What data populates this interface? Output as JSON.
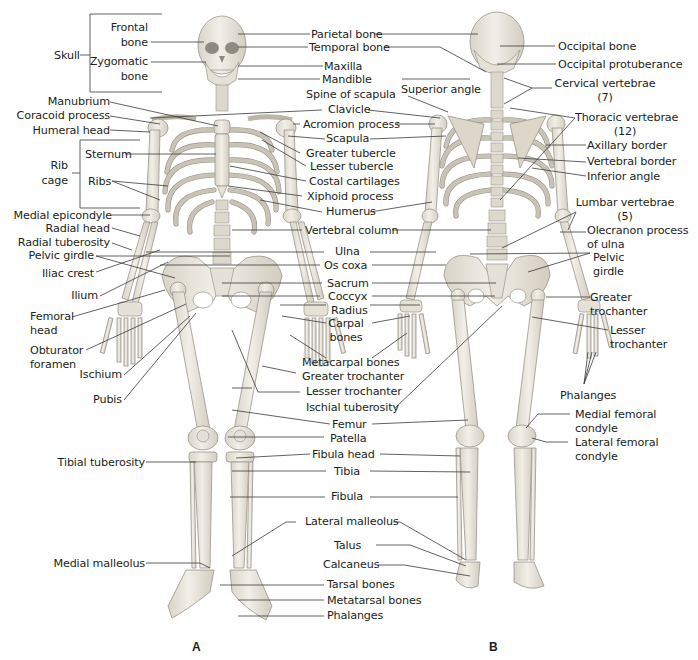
{
  "figure": {
    "panels": [
      {
        "id": "A",
        "label": "A",
        "view": "anterior"
      },
      {
        "id": "B",
        "label": "B",
        "view": "posterior"
      }
    ],
    "colors": {
      "bone_fill": "#ece8df",
      "bone_shade": "#d3cdc0",
      "bone_outline": "#9a958c",
      "leader_line": "#3a3a3a",
      "text": "#231f20",
      "background": "#ffffff"
    }
  },
  "labels": {
    "left": {
      "skull": "Skull",
      "frontal_bone": [
        "Frontal",
        "bone"
      ],
      "zygomatic_bone": [
        "Zygomatic",
        "bone"
      ],
      "manubrium": "Manubrium",
      "coracoid_process": "Coracoid process",
      "humeral_head": "Humeral head",
      "rib_cage": [
        "Rib",
        "cage"
      ],
      "sternum": "Sternum",
      "ribs": "Ribs",
      "medial_epicondyle": "Medial epicondyle",
      "radial_head": "Radial head",
      "radial_tuberosity": "Radial tuberosity",
      "pelvic_girdle": "Pelvic girdle",
      "iliac_crest": "Iliac crest",
      "ilium": "Ilium",
      "femoral_head": [
        "Femoral",
        "head"
      ],
      "obturator_foramen": [
        "Obturator",
        "foramen"
      ],
      "ischium": "Ischium",
      "pubis": "Pubis",
      "tibial_tuberosity": "Tibial tuberosity",
      "medial_malleolus": "Medial malleolus"
    },
    "center": {
      "parietal_bone": "Parietal bone",
      "temporal_bone": "Temporal bone",
      "maxilla": "Maxilla",
      "mandible": "Mandible",
      "spine_of_scapula": "Spine of scapula",
      "clavicle": "Clavicle",
      "acromion_process": "Acromion process",
      "scapula": "Scapula",
      "greater_tubercle": "Greater tubercle",
      "lesser_tubercle": "Lesser tubercle",
      "costal_cartilages": "Costal cartilages",
      "xiphoid_process": "Xiphoid process",
      "humerus": "Humerus",
      "vertebral_column": "Vertebral column",
      "ulna": "Ulna",
      "os_coxa": "Os coxa",
      "sacrum": "Sacrum",
      "coccyx": "Coccyx",
      "radius": "Radius",
      "carpal_bones": [
        "Carpal",
        "bones"
      ],
      "metacarpal_bones": "Metacarpal bones",
      "greater_trochanter": "Greater trochanter",
      "lesser_trochanter": "Lesser trochanter",
      "ischial_tuberosity": "Ischial tuberosity",
      "femur": "Femur",
      "patella": "Patella",
      "fibula_head": "Fibula head",
      "tibia": "Tibia",
      "fibula": "Fibula",
      "lateral_malleolus": "Lateral malleolus",
      "talus": "Talus",
      "calcaneus": "Calcaneus",
      "tarsal_bones": "Tarsal bones",
      "metatarsal_bones": "Metatarsal bones",
      "phalanges": "Phalanges"
    },
    "right": {
      "superior_angle": "Superior angle",
      "occipital_bone": "Occipital bone",
      "occipital_protuberance": "Occipital protuberance",
      "cervical_vertebrae": [
        "Cervical vertebrae",
        "(7)"
      ],
      "thoracic_vertebrae": [
        "Thoracic vertebrae",
        "(12)"
      ],
      "axillary_border": "Axillary border",
      "vertebral_border": "Vertebral border",
      "inferior_angle": "Inferior angle",
      "lumbar_vertebrae": [
        "Lumbar vertebrae",
        "(5)"
      ],
      "olecranon_process": [
        "Olecranon process",
        "of ulna"
      ],
      "pelvic_girdle": [
        "Pelvic",
        "girdle"
      ],
      "greater_trochanter": [
        "Greater",
        "trochanter"
      ],
      "lesser_trochanter": [
        "Lesser",
        "trochanter"
      ],
      "phalanges": "Phalanges",
      "medial_femoral_condyle": [
        "Medial femoral",
        "condyle"
      ],
      "lateral_femoral_condyle": [
        "Lateral femoral",
        "condyle"
      ]
    }
  }
}
